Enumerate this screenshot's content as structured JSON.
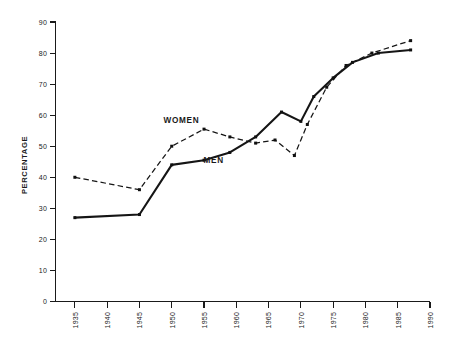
{
  "chart_data": {
    "type": "line",
    "title": "",
    "xlabel": "",
    "ylabel": "PERCENTAGE",
    "xlim": [
      1932,
      1990
    ],
    "ylim": [
      0,
      90
    ],
    "grid": false,
    "legend_position": "inline-annotations",
    "x_ticks": [
      1935,
      1940,
      1945,
      1950,
      1955,
      1960,
      1965,
      1970,
      1975,
      1980,
      1985,
      1990
    ],
    "y_ticks": [
      0,
      10,
      20,
      30,
      40,
      50,
      60,
      70,
      80,
      90
    ],
    "series": [
      {
        "name": "WOMEN",
        "style": "dashed",
        "marker": "square",
        "x": [
          1935,
          1945,
          1950,
          1955,
          1959,
          1963,
          1966,
          1969,
          1971,
          1974,
          1977,
          1981,
          1987
        ],
        "values": [
          40,
          36,
          50,
          55.5,
          53,
          51,
          52,
          47,
          57,
          69,
          76,
          80,
          84
        ]
      },
      {
        "name": "MEN",
        "style": "solid",
        "marker": "square",
        "x": [
          1935,
          1945,
          1950,
          1955,
          1959,
          1963,
          1967,
          1970,
          1972,
          1975,
          1978,
          1982,
          1987
        ],
        "values": [
          27,
          28,
          44,
          45.5,
          48,
          53,
          61,
          58,
          66,
          72,
          77,
          80,
          81
        ]
      }
    ],
    "annotations": [
      {
        "text": "WOMEN",
        "x": 1951.5,
        "y": 57.5
      },
      {
        "text": "MEN",
        "x": 1956.5,
        "y": 44.5
      }
    ]
  },
  "axis": {
    "y_label": "PERCENTAGE"
  }
}
